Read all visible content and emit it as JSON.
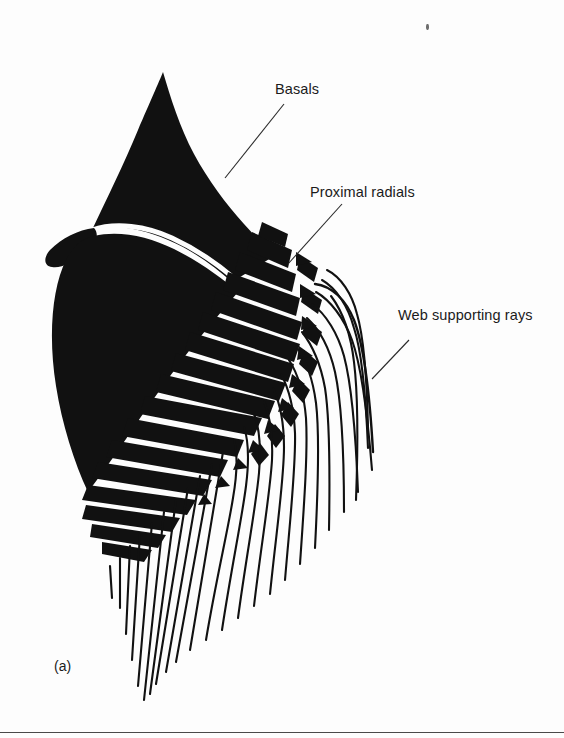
{
  "figure": {
    "caption": "(a)",
    "background_color": "#fdfdfd",
    "ink_color": "#111111",
    "rule_color": "#4a4a4a"
  },
  "labels": {
    "basals": "Basals",
    "proximal_radials": "Proximal radials",
    "web_supporting_rays": "Web supporting rays"
  },
  "leaders": [
    {
      "name": "basals-leader",
      "x1": 225,
      "y1": 178,
      "x2": 284,
      "y2": 104
    },
    {
      "name": "proximal-radials-leader",
      "x1": 288,
      "y1": 264,
      "x2": 342,
      "y2": 204
    },
    {
      "name": "web-supporting-rays-leader",
      "x1": 372,
      "y1": 379,
      "x2": 409,
      "y2": 340
    }
  ],
  "structures": {
    "upper_basal_plate": {
      "name": "upper basal plate",
      "fill": "#111111",
      "path": "M 163 72 C 176 110 196 150 222 180 C 240 202 258 220 270 234 L 236 268 C 214 252 186 236 160 228 C 128 218 104 218 86 226 C 104 190 128 150 142 116 C 152 96 158 82 163 72 Z"
    },
    "lower_basal_plate": {
      "name": "lower basal plate",
      "fill": "#111111",
      "path": "M 86 232 C 106 224 132 224 160 233 C 188 242 214 257 236 273 L 200 318 C 178 344 152 382 124 424 C 110 446 96 468 84 486 C 70 456 58 420 52 382 C 44 334 48 286 60 256 C 68 240 76 234 86 232 Z"
    },
    "upper_left_spur": {
      "name": "upper basal left spur",
      "fill": "#111111",
      "path": "M 86 226 C 72 229 58 237 48 249 C 42 257 42 264 48 266 C 58 270 72 262 84 250 C 92 242 90 232 86 226 Z"
    },
    "radial_plate_rows": [
      {
        "row": 1,
        "count": 9,
        "note": "longest upper row of proximal radials"
      },
      {
        "row": 2,
        "count": 9,
        "note": "second row of proximal radials"
      },
      {
        "row": 3,
        "count": 8,
        "note": "third row, shorter wedges"
      },
      {
        "row": 4,
        "count": 7,
        "note": "fourth row near distal margin"
      }
    ],
    "web_ray_count": 26,
    "radial_plate_fill": "#111111",
    "web_ray_stroke": "#111111"
  }
}
